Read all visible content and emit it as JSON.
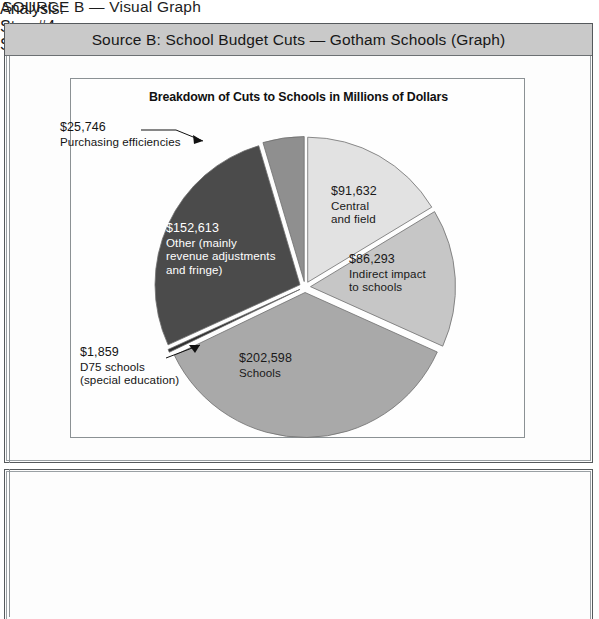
{
  "caption": "SOURCE B — Visual Graph",
  "source_box": {
    "title": "Source B: School Budget Cuts — Gotham Schools (Graph)",
    "title_band_color": "#c9c9c9"
  },
  "chart_data": {
    "type": "pie",
    "title": "Breakdown of Cuts to Schools in Millions of Dollars",
    "xlabel": "",
    "ylabel": "",
    "units": "dollars (thousands, as labeled)",
    "legend": "none (labels on slices and callouts)",
    "total": 560741,
    "categories": [
      "Central and field",
      "Indirect impact to schools",
      "Schools",
      "D75 schools (special education)",
      "Other (mainly revenue adjustments and fringe)",
      "Purchasing efficiencies"
    ],
    "values": [
      91632,
      86293,
      202598,
      1859,
      152613,
      25746
    ],
    "slices": [
      {
        "name": "Central and field",
        "amount_label": "$91,632",
        "name_lines": [
          "Central",
          "and field"
        ],
        "value": 91632,
        "color": "#e2e2e2",
        "label_placement": "inside"
      },
      {
        "name": "Indirect impact to schools",
        "amount_label": "$86,293",
        "name_lines": [
          "Indirect impact",
          "to schools"
        ],
        "value": 86293,
        "color": "#c6c6c6",
        "label_placement": "inside"
      },
      {
        "name": "Schools",
        "amount_label": "$202,598",
        "name_lines": [
          "Schools"
        ],
        "value": 202598,
        "color": "#a9a9a9",
        "label_placement": "inside"
      },
      {
        "name": "D75 schools (special education)",
        "amount_label": "$1,859",
        "name_lines": [
          "D75 schools",
          "(special education)"
        ],
        "value": 1859,
        "color": "#2f2f2f",
        "label_placement": "callout"
      },
      {
        "name": "Other (mainly revenue adjustments and fringe)",
        "amount_label": "$152,613",
        "name_lines": [
          "Other (mainly",
          "revenue adjustments",
          "and fringe)"
        ],
        "value": 152613,
        "color": "#4b4b4b",
        "label_placement": "inside"
      },
      {
        "name": "Purchasing efficiencies",
        "amount_label": "$25,746",
        "name_lines": [
          "Purchasing efficiencies"
        ],
        "value": 25746,
        "color": "#8f8f8f",
        "label_placement": "callout"
      }
    ]
  },
  "analysis": {
    "heading": "Analysis:",
    "step4": "Step #4:",
    "step5": "Step #5:"
  }
}
